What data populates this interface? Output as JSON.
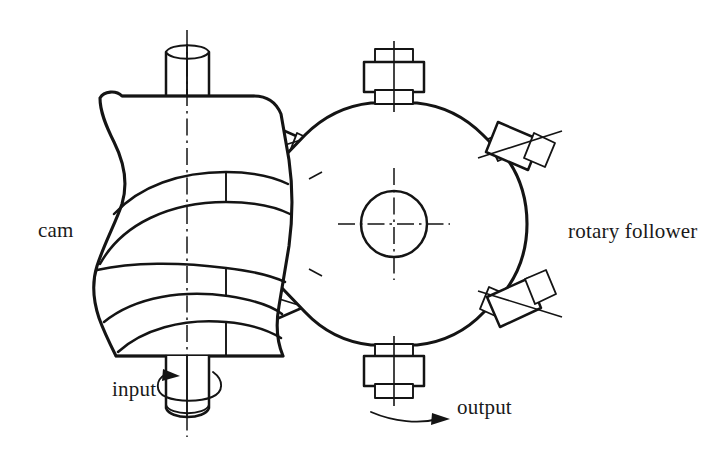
{
  "diagram": {
    "background_color": "#ffffff",
    "line_color": "#141414",
    "width": 725,
    "height": 465,
    "labels": {
      "cam": "cam",
      "rotary_follower": "rotary follower",
      "input": "input",
      "output": "output"
    },
    "components": {
      "cam_body": "globoidal-cam",
      "input_shaft": "input-shaft",
      "follower_turret": "rotary-follower-turret",
      "turret_hub": "turret-hub-bore",
      "roller_count": 8
    },
    "annotations": {
      "input_rotation": "curved arrow encircling input shaft",
      "output_rotation": "curved arrow pointing right below turret"
    }
  }
}
